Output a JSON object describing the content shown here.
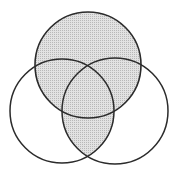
{
  "diagram": {
    "type": "venn",
    "sets": [
      {
        "id": "top",
        "cx": 88,
        "cy": 65,
        "r": 53,
        "shaded": true
      },
      {
        "id": "left",
        "cx": 62,
        "cy": 111,
        "r": 52,
        "shaded": false
      },
      {
        "id": "right",
        "cx": 115,
        "cy": 111,
        "r": 53,
        "shaded": false
      }
    ],
    "shaded_regions": [
      "top",
      "left ∩ right"
    ],
    "colors": {
      "background": "#ffffff",
      "stroke": "#2b2b2b",
      "shade": "#d4d4d4"
    }
  }
}
